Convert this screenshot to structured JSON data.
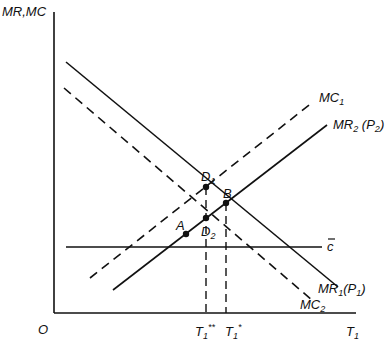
{
  "diagram": {
    "type": "economics-marginal-revenue-cost",
    "colors": {
      "ink": "#111111",
      "background": "#ffffff"
    },
    "axes": {
      "y_label": "MR,MC",
      "x_label_main": "T",
      "x_label_sub": "1",
      "origin_label": "O"
    },
    "curves": {
      "mc1": {
        "label_main": "MC",
        "label_sub": "1",
        "style": "dashed",
        "slope": "upward"
      },
      "mr2": {
        "label_main": "MR",
        "label_sub": "2",
        "label_paren_main": "P",
        "label_paren_sub": "2",
        "style": "solid",
        "slope": "upward"
      },
      "mr1": {
        "label_main": "MR",
        "label_sub": "1",
        "label_paren_main": "P",
        "label_paren_sub": "1",
        "style": "solid",
        "slope": "downward"
      },
      "mc2": {
        "label_main": "MC",
        "label_sub": "2",
        "style": "dashed",
        "slope": "downward"
      },
      "cbar": {
        "label": "c",
        "style": "solid",
        "slope": "horizontal",
        "overline": true
      }
    },
    "points": {
      "d1": {
        "label_main": "D",
        "label_sub": "1"
      },
      "d2": {
        "label_main": "D",
        "label_sub": "2"
      },
      "a": {
        "label": "A"
      },
      "b": {
        "label": "B"
      }
    },
    "x_ticks": {
      "t1_double_star": {
        "main": "T",
        "sub": "1",
        "sup": "**"
      },
      "t1_star": {
        "main": "T",
        "sub": "1",
        "sup": "*"
      }
    }
  }
}
